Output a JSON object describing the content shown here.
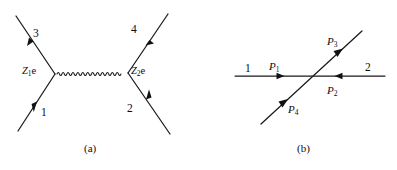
{
  "figure": {
    "background_color": "#ffffff",
    "ink_color": "#1a1a1a",
    "width": 397,
    "height": 170
  },
  "panel_a": {
    "caption": "(a)",
    "description": "Feynman diagram: two fermion lines exchanging a photon propagator",
    "vertex_labels": [
      {
        "name": "left-vertex",
        "charge": "Z",
        "index": "1",
        "coupling": "e",
        "x": 22,
        "y": 66
      },
      {
        "name": "right-vertex",
        "charge": "Z",
        "index": "2",
        "coupling": "e",
        "x": 131,
        "y": 66
      }
    ],
    "leg_labels": [
      {
        "name": "leg-3",
        "text": "3",
        "x": 33,
        "y": 28
      },
      {
        "name": "leg-4",
        "text": "4",
        "x": 131,
        "y": 24
      },
      {
        "name": "leg-1",
        "text": "1",
        "x": 41,
        "y": 107
      },
      {
        "name": "leg-2",
        "text": "2",
        "x": 127,
        "y": 103
      }
    ],
    "propagator": {
      "type": "wavy-photon",
      "oscillations": 14,
      "x_start": 57,
      "x_end": 126,
      "y": 74,
      "amplitude": 2.6
    }
  },
  "panel_b": {
    "caption": "(b)",
    "description": "Two straight lines crossing, with four labelled momentum arrows",
    "line_labels": [
      {
        "name": "line-1",
        "text": "1",
        "x": 245,
        "y": 63
      },
      {
        "name": "line-2",
        "text": "2",
        "x": 365,
        "y": 62
      }
    ],
    "momentum_labels": [
      {
        "name": "momentum-p1",
        "symbol": "P",
        "index": "1",
        "x": 269,
        "y": 61
      },
      {
        "name": "momentum-p3",
        "symbol": "P",
        "index": "3",
        "x": 327,
        "y": 36
      },
      {
        "name": "momentum-p2",
        "symbol": "P",
        "index": "2",
        "x": 327,
        "y": 85
      },
      {
        "name": "momentum-p4",
        "symbol": "P",
        "index": "4",
        "x": 288,
        "y": 104
      }
    ]
  }
}
